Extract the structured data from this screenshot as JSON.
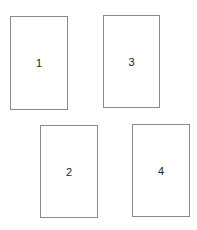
{
  "diagram": {
    "background": "#ffffff",
    "border_color": "#8a8a8a",
    "boxes": [
      {
        "label": "1",
        "x": 10,
        "y": 16,
        "w": 58,
        "h": 94
      },
      {
        "label": "3",
        "x": 103,
        "y": 15,
        "w": 57,
        "h": 93
      },
      {
        "label": "2",
        "x": 40,
        "y": 125,
        "w": 58,
        "h": 93
      },
      {
        "label": "4",
        "x": 132,
        "y": 124,
        "w": 58,
        "h": 93
      }
    ]
  }
}
